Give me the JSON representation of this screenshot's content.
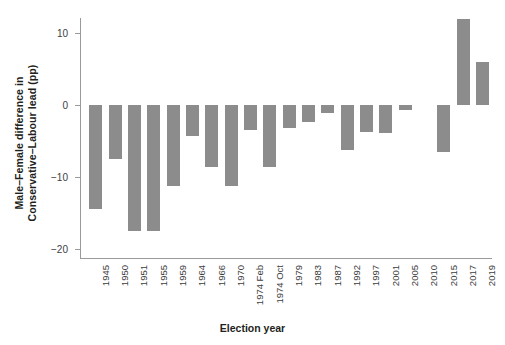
{
  "chart_data": {
    "type": "bar",
    "title": "",
    "xlabel": "Election year",
    "ylabel_line1": "Male–Female difference in",
    "ylabel_line2": "Conservative–Labour lead (pp)",
    "categories": [
      "1945",
      "1950",
      "1951",
      "1955",
      "1959",
      "1964",
      "1966",
      "1970",
      "1974 Feb",
      "1974 Oct",
      "1979",
      "1983",
      "1987",
      "1992",
      "1997",
      "2001",
      "2005",
      "2010",
      "2015",
      "2017",
      "2019"
    ],
    "values": [
      -14.5,
      -7.5,
      -17.5,
      -17.5,
      -11.2,
      -4.3,
      -8.6,
      -11.2,
      -3.5,
      -8.6,
      -3.2,
      -2.4,
      -1.1,
      -6.3,
      -3.8,
      -3.9,
      -0.7,
      0.0,
      -6.5,
      12.0,
      6.0
    ],
    "ylim": [
      -21,
      13
    ],
    "yticks": [
      10,
      0,
      -10,
      -20
    ],
    "ytick_labels": [
      "10",
      "0",
      "−10",
      "−20"
    ],
    "grid": false,
    "legend": false,
    "bar_color": "#8c8c8c",
    "axis_color": "#9a9a9a",
    "background": "#ffffff"
  }
}
